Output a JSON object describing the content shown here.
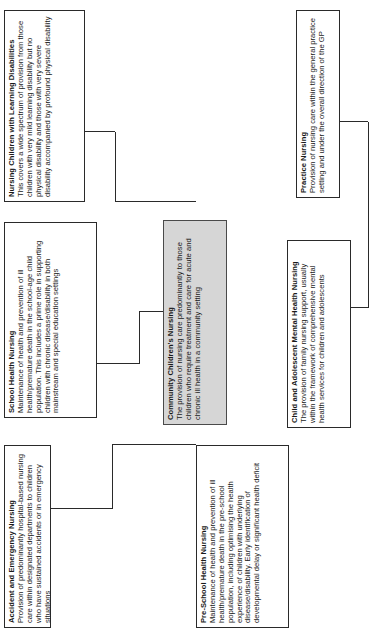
{
  "diagram": {
    "type": "organisational-chart",
    "orientation": "rotated-90-counterclockwise",
    "hub": "Community Children's Nursing",
    "colors": {
      "node_border": "#2a2a2a",
      "node_fill": "#ffffff",
      "hub_fill": "#d6d6d6",
      "connector": "#2a2a2a",
      "text": "#1a1a1a",
      "page_background": "#ffffff"
    },
    "nodes": [
      {
        "id": "accident-and-emergency-nursing",
        "title": "Accident and Emergency Nursing",
        "body": "Provision of predominantly hospital-based nursing care within designated departments to children who have sustained accidents or in emergency situations",
        "shaded": false
      },
      {
        "id": "pre-school-health-nursing",
        "title": "Pre-School Health Nursing",
        "body": "Maintenance of health and prevention of ill health/premature death in the pre-school population, including optimising the health experience of children with underlying disease/disability.  Early identification of developmental delay or significant health deficit",
        "shaded": false
      },
      {
        "id": "school-health-nursing",
        "title": "School Health Nursing",
        "body": "Maintenance of health and prevention of ill health/premature death in the school-age child population.  This includes a prime role in supporting children with chronic disease/disability in both mainstream and special education settings",
        "shaded": false
      },
      {
        "id": "community-childrens-nursing",
        "title": "Community Children's Nursing",
        "body": "The provision of nursing care predominantly to those children who require treatment and care for acute and chronic ill health in a community setting",
        "shaded": true
      },
      {
        "id": "child-and-adolescent-mental-health-nursing",
        "title": "Child and Adolescent Mental Health Nursing",
        "body": "The provision of family nursing support, usually within the framework of comprehensive mental health services for children and adolescents",
        "shaded": false
      },
      {
        "id": "nursing-children-with-learning-disabilities",
        "title": "Nursing Children with Learning Disabilities",
        "body": "This covers a wide spectrum of provision from those children with very mild learning disability but no physical disability and those with very severe disability accompanied by profound physical disability",
        "shaded": false
      },
      {
        "id": "practice-nursing",
        "title": "Practice Nursing",
        "body": "Provision of nursing care within the general practice setting and under the overall direction of the GP",
        "shaded": false
      }
    ]
  }
}
